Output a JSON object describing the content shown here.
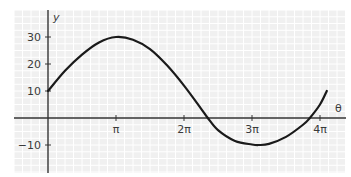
{
  "chart_data": {
    "type": "line",
    "title": "",
    "xlabel": "θ",
    "ylabel": "y",
    "grid": true,
    "xlim": [
      -1.0,
      4.4
    ],
    "ylim": [
      -20,
      40
    ],
    "x_unit": "π",
    "x_ticks": [
      {
        "value": 1,
        "label": "π"
      },
      {
        "value": 2,
        "label": "2π"
      },
      {
        "value": 3,
        "label": "3π"
      },
      {
        "value": 4,
        "label": "4π"
      }
    ],
    "y_ticks": [
      {
        "value": 30,
        "label": "30"
      },
      {
        "value": 20,
        "label": "20"
      },
      {
        "value": 10,
        "label": "10"
      },
      {
        "value": -10,
        "label": "−10"
      }
    ],
    "series": [
      {
        "name": "y",
        "x_in_pi": [
          0,
          0.25,
          0.5,
          0.75,
          1.0,
          1.25,
          1.5,
          1.75,
          2.0,
          2.25,
          2.35,
          2.5,
          2.75,
          3.0,
          3.1,
          3.25,
          3.5,
          3.75,
          3.85,
          4.0,
          4.1
        ],
        "values": [
          10,
          17.5,
          23.5,
          28,
          30,
          29,
          25.5,
          19.5,
          12,
          3.5,
          0,
          -4.5,
          -8.5,
          -9.8,
          -10,
          -9.6,
          -7,
          -2.5,
          0,
          5,
          10
        ]
      }
    ]
  },
  "colors": {
    "background": "#ffffff",
    "grid_bg": "#f0f0f0",
    "grid_line": "#ffffff",
    "axis": "#333333",
    "curve": "#1a1a1a",
    "text": "#3a3a3a"
  }
}
